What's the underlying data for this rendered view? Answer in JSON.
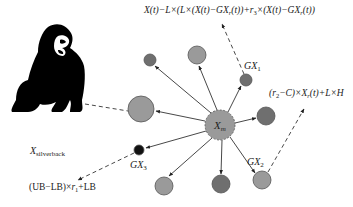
{
  "diagram": {
    "colors": {
      "node_light": "#9a9a9a",
      "node_dark": "#6f6f6f",
      "node_black": "#111111",
      "edge": "#333333",
      "silverback": "#000000"
    },
    "center_node": {
      "id": "Xm",
      "label": "X",
      "subscript": "m",
      "x": 220,
      "y": 125,
      "r": 15
    },
    "nodes": [
      {
        "id": "n_topleft",
        "x": 150,
        "y": 60,
        "r": 6,
        "shade": "dark",
        "label": ""
      },
      {
        "id": "n_top",
        "x": 197,
        "y": 55,
        "r": 9,
        "shade": "light",
        "label": ""
      },
      {
        "id": "GX1",
        "x": 246,
        "y": 80,
        "r": 6,
        "shade": "dark",
        "label": "GX",
        "subscript": "1"
      },
      {
        "id": "n_left",
        "x": 141,
        "y": 109,
        "r": 13,
        "shade": "light",
        "label": ""
      },
      {
        "id": "n_right",
        "x": 266,
        "y": 116,
        "r": 9,
        "shade": "dark",
        "label": ""
      },
      {
        "id": "GX3",
        "x": 139,
        "y": 150,
        "r": 5,
        "shade": "black",
        "label": "GX",
        "subscript": "3"
      },
      {
        "id": "n_bottomleft",
        "x": 164,
        "y": 186,
        "r": 9,
        "shade": "light",
        "label": ""
      },
      {
        "id": "n_bottommid",
        "x": 221,
        "y": 184,
        "r": 9,
        "shade": "dark",
        "label": ""
      },
      {
        "id": "GX2",
        "x": 262,
        "y": 180,
        "r": 9,
        "shade": "light",
        "label": "GX",
        "subscript": "2"
      }
    ],
    "silverback": {
      "label": "X",
      "subscript": "silverback"
    },
    "formulas": {
      "top": "X(t)−L×(L×(X(t)−GXr(t))+r3×(X(t)−GXr(t))",
      "right": "(r2−C)×Xr(t)+L×H",
      "bottom_left": "(UB−LB)×r1+LB"
    }
  }
}
